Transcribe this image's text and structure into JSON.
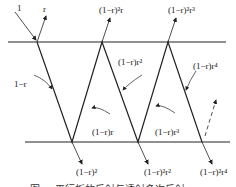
{
  "diagram": {
    "labels": {
      "incident": "1",
      "reflect_1": "r",
      "reflect_2": "(1−r)²r",
      "reflect_3": "(1−r)²r³",
      "trans_in": "1−r",
      "inner_1": "(1−r)r",
      "inner_2": "(1−r)r²",
      "inner_3": "(1−r)r³",
      "inner_4": "(1−r)r⁴",
      "trans_1": "(1−r)²",
      "trans_2": "(1−r)²r²",
      "trans_3": "(1−r)²r⁴"
    },
    "caption": "图 — 平行板的反射与透射多次反射"
  }
}
